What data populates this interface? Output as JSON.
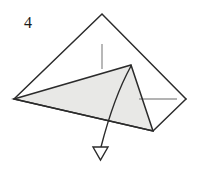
{
  "diagram": {
    "step_label": "4",
    "type": "origami-instruction",
    "canvas": {
      "width": 199,
      "height": 170
    },
    "colors": {
      "background": "#ffffff",
      "outline": "#2b2b2b",
      "flap_fill": "#e8e8e6",
      "flap_outline": "#2b2b2b",
      "crease_guide": "#9a9a9a",
      "arrow": "#2b2b2b",
      "label": "#1a1a1a"
    },
    "shapes": {
      "base_triangle": {
        "name": "base-kite-outline",
        "points": "102,14 186,99 148,133 14,99",
        "description": "Outer folded paper silhouette"
      },
      "base_triangle_upper": {
        "name": "base-upper-edges",
        "points": "14,99 102,14 186,99",
        "description": "Upper left and right edges meeting at apex"
      },
      "shaded_flap": {
        "name": "shaded-flap",
        "points": "14,99 131,65 153,131",
        "description": "Light grey shaded triangular flap being folded"
      },
      "flap_inner_edge": {
        "name": "flap-inner-crease",
        "points": "131,65 153,131",
        "description": "Right edge of shaded flap"
      },
      "bottom_edge": {
        "name": "base-bottom-edge",
        "points": "14,99 153,131 186,99",
        "description": "Lower silhouette edge"
      }
    },
    "guides": [
      {
        "name": "vertical-crease-guide",
        "orientation": "vertical",
        "x1": 102,
        "y1": 44,
        "x2": 102,
        "y2": 69
      },
      {
        "name": "horizontal-crease-guide",
        "orientation": "horizontal",
        "x1": 139,
        "y1": 99,
        "x2": 177,
        "y2": 99
      }
    ],
    "arrow": {
      "name": "fold-down-arrow",
      "style": "curved-hollow-head",
      "path": "M131,66 C120,86 110,112 101,147",
      "head": {
        "points": "93,147 108,147 100.5,160",
        "fill": "#ffffff",
        "stroke": "#2b2b2b"
      },
      "direction": "down",
      "meaning": "fold this flap downward"
    }
  }
}
